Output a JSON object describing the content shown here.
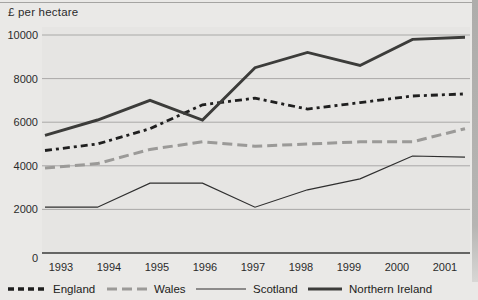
{
  "figure": {
    "ylabel": "£ per hectare"
  },
  "chart_data": {
    "type": "line",
    "title": "",
    "ylabel": "£ per hectare",
    "xlabel": "",
    "categories": [
      "1993",
      "1994",
      "1995",
      "1996",
      "1997",
      "1998",
      "1999",
      "2000",
      "2001"
    ],
    "series": [
      {
        "name": "England",
        "style": "black-dashed",
        "color": "#1f1f1f",
        "values": [
          4700,
          5000,
          5700,
          6800,
          7100,
          6600,
          6900,
          7200,
          7300
        ]
      },
      {
        "name": "Wales",
        "style": "gray-dashed",
        "color": "#9b9a98",
        "values": [
          3900,
          4100,
          4750,
          5100,
          4900,
          5000,
          5100,
          5100,
          5700
        ]
      },
      {
        "name": "Scotland",
        "style": "thin-solid",
        "color": "#2f2f2f",
        "values": [
          2100,
          2100,
          3200,
          3200,
          2100,
          2900,
          3400,
          4450,
          4400
        ]
      },
      {
        "name": "Northern Ireland",
        "style": "thick-solid",
        "color": "#3c3c3a",
        "values": [
          5400,
          6100,
          7000,
          6100,
          8500,
          9200,
          8600,
          9800,
          9900
        ]
      }
    ],
    "ylim": [
      0,
      10000
    ],
    "yticks": [
      0,
      2000,
      4000,
      6000,
      8000,
      10000
    ],
    "grid": "horizontal",
    "gridline_color": "#a3a2a0",
    "axis_color": "#3a3a3a",
    "tick_label_color": "#2b2b2b",
    "plot_background": "#e6e5e3",
    "legend_position": "bottom"
  },
  "legend": {
    "items": [
      {
        "label": "England"
      },
      {
        "label": "Wales"
      },
      {
        "label": "Scotland"
      },
      {
        "label": "Northern Ireland"
      }
    ]
  }
}
